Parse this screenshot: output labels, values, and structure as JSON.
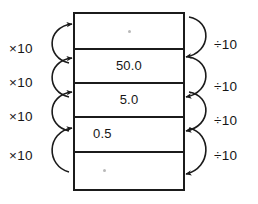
{
  "diagram": {
    "accent_color": "#1b1b1b",
    "background_color": "#ffffff",
    "table": {
      "name": "place-value-column",
      "rows": [
        {
          "id": "row-1",
          "value": "",
          "mark": "faint-dot",
          "align": "center"
        },
        {
          "id": "row-2",
          "value": "50.0",
          "mark": "",
          "align": "center"
        },
        {
          "id": "row-3",
          "value": "5.0",
          "mark": "",
          "align": "center"
        },
        {
          "id": "row-4",
          "value": "0.5",
          "mark": "",
          "align": "left"
        },
        {
          "id": "row-5",
          "value": "",
          "mark": "faint-dot",
          "align": "left"
        }
      ]
    },
    "left_arrows": {
      "direction": "upward",
      "labels": [
        {
          "id": "multiply-1",
          "text": "×10"
        },
        {
          "id": "multiply-2",
          "text": "×10"
        },
        {
          "id": "multiply-3",
          "text": "×10"
        },
        {
          "id": "multiply-4",
          "text": "×10"
        }
      ]
    },
    "right_arrows": {
      "direction": "downward",
      "labels": [
        {
          "id": "divide-1",
          "text": "÷10"
        },
        {
          "id": "divide-2",
          "text": "÷10"
        },
        {
          "id": "divide-3",
          "text": "÷10"
        },
        {
          "id": "divide-4",
          "text": "÷10"
        }
      ]
    }
  }
}
